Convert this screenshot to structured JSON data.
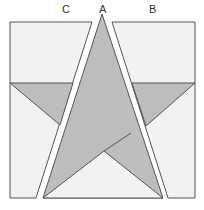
{
  "diagram": {
    "type": "quilt-block-pieces",
    "labels": [
      {
        "id": "C",
        "text": "C",
        "x": 62,
        "y": 4
      },
      {
        "id": "A",
        "text": "A",
        "x": 99,
        "y": 4
      },
      {
        "id": "B",
        "text": "B",
        "x": 149,
        "y": 4
      }
    ],
    "colors": {
      "background": "#f2f2f2",
      "star": "#bdbdbd",
      "outline": "#555555",
      "gap": "#ffffff"
    }
  }
}
